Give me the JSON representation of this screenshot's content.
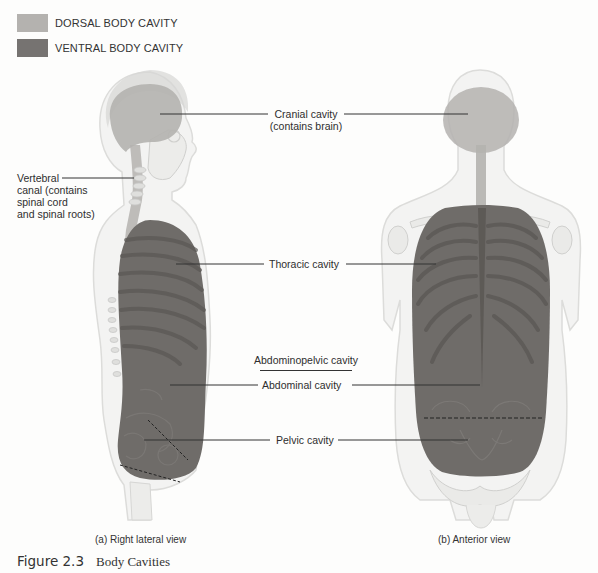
{
  "legend": {
    "items": [
      {
        "label": "DORSAL BODY CAVITY",
        "color": "#b4b2af"
      },
      {
        "label": "VENTRAL BODY CAVITY",
        "color": "#767371"
      }
    ]
  },
  "labels": {
    "cranial": {
      "line1": "Cranial cavity",
      "line2": "(contains brain)"
    },
    "vertebral": {
      "line1": "Vertebral",
      "line2": "canal (contains",
      "line3": "spinal cord",
      "line4": "and spinal roots)"
    },
    "thoracic": "Thoracic cavity",
    "abdominopelvic": "Abdominopelvic cavity",
    "abdominal": "Abdominal cavity",
    "pelvic": "Pelvic cavity"
  },
  "views": {
    "lateral": "(a) Right lateral view",
    "anterior": "(b) Anterior view"
  },
  "figure": {
    "number": "Figure 2.3",
    "title": "Body Cavities"
  },
  "colors": {
    "background": "#fdfdfc",
    "body_outline": "#e4e4e2",
    "bone": "#eeeeec",
    "dorsal": "#b4b2af",
    "ventral": "#6f6c69",
    "rib_shadow": "#5c5956",
    "leader_line": "#333333"
  }
}
